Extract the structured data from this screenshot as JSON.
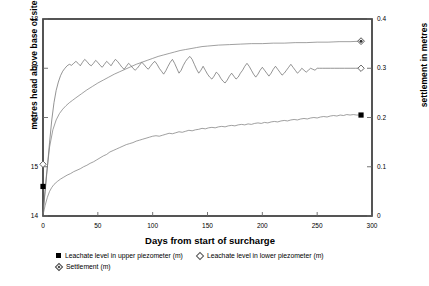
{
  "chart_data": {
    "type": "line",
    "title": "",
    "xlabel": "Days from start of surcharge",
    "ylabel": "metres head above base of site",
    "ylabel_right": "settlement in metres",
    "xlim": [
      0,
      300
    ],
    "ylim": [
      14,
      18
    ],
    "ylim_right": [
      0,
      0.4
    ],
    "grid": false,
    "legend_position": "bottom",
    "xticks": [
      "0",
      "50",
      "100",
      "150",
      "200",
      "250",
      "300"
    ],
    "xtick_values": [
      0,
      50,
      100,
      150,
      200,
      250,
      300
    ],
    "yticks_left": [
      "14",
      "15",
      "16",
      "17",
      "18"
    ],
    "ytick_values_left": [
      14,
      15,
      16,
      17,
      18
    ],
    "yticks_right": [
      "0",
      "0.1",
      "0.2",
      "0.3",
      "0.4"
    ],
    "ytick_values_right": [
      0,
      0.1,
      0.2,
      0.3,
      0.4
    ],
    "series": [
      {
        "name": "Leachate level in upper piezometer (m)",
        "axis": "left",
        "marker": "filled-square",
        "marker_color": "#000000",
        "line_color": "#777777",
        "end_point": {
          "x": 290,
          "y": 16.05
        },
        "x": [
          0,
          2,
          4,
          6,
          8,
          10,
          13,
          16,
          19,
          22,
          25,
          28,
          31,
          34,
          37,
          40,
          43,
          46,
          49,
          52,
          55,
          58,
          61,
          64,
          67,
          70,
          73,
          76,
          79,
          82,
          85,
          88,
          91,
          94,
          97,
          100,
          103,
          106,
          109,
          112,
          115,
          118,
          121,
          124,
          127,
          130,
          133,
          136,
          139,
          142,
          145,
          148,
          151,
          154,
          157,
          160,
          163,
          166,
          169,
          172,
          175,
          178,
          181,
          184,
          187,
          190,
          193,
          196,
          199,
          202,
          205,
          208,
          211,
          214,
          217,
          220,
          223,
          226,
          229,
          232,
          235,
          238,
          241,
          244,
          247,
          250,
          253,
          256,
          259,
          262,
          265,
          268,
          271,
          274,
          277,
          280,
          283,
          286,
          290
        ],
        "y": [
          14.02,
          14.22,
          14.38,
          14.5,
          14.58,
          14.64,
          14.7,
          14.75,
          14.79,
          14.83,
          14.86,
          14.9,
          14.93,
          14.96,
          15.0,
          15.03,
          15.07,
          15.1,
          15.14,
          15.18,
          15.22,
          15.25,
          15.3,
          15.33,
          15.36,
          15.39,
          15.42,
          15.45,
          15.47,
          15.49,
          15.52,
          15.54,
          15.56,
          15.58,
          15.6,
          15.62,
          15.63,
          15.62,
          15.64,
          15.66,
          15.68,
          15.67,
          15.69,
          15.71,
          15.7,
          15.72,
          15.74,
          15.73,
          15.75,
          15.76,
          15.78,
          15.77,
          15.79,
          15.8,
          15.79,
          15.81,
          15.82,
          15.81,
          15.83,
          15.84,
          15.83,
          15.85,
          15.86,
          15.85,
          15.87,
          15.86,
          15.88,
          15.89,
          15.88,
          15.9,
          15.89,
          15.91,
          15.92,
          15.91,
          15.93,
          15.94,
          15.93,
          15.95,
          15.96,
          15.95,
          15.97,
          15.98,
          15.97,
          15.99,
          16.0,
          15.99,
          16.01,
          16.02,
          16.01,
          16.03,
          16.04,
          16.03,
          16.05,
          16.04,
          16.06,
          16.05,
          16.06,
          16.05,
          16.05
        ]
      },
      {
        "name": "Leachate level in lower piezometer (m)",
        "axis": "left",
        "marker": "open-diamond",
        "marker_color": "#555555",
        "line_color": "#666666",
        "end_point": {
          "x": 290,
          "y": 17.0
        },
        "x": [
          0,
          2,
          4,
          6,
          8,
          10,
          12,
          14,
          16,
          18,
          20,
          22,
          24,
          26,
          28,
          30,
          32,
          34,
          36,
          38,
          40,
          42,
          44,
          46,
          48,
          50,
          52,
          54,
          56,
          58,
          60,
          62,
          64,
          66,
          68,
          70,
          72,
          74,
          76,
          78,
          80,
          82,
          84,
          86,
          88,
          90,
          92,
          94,
          96,
          98,
          100,
          102,
          104,
          106,
          108,
          110,
          112,
          114,
          116,
          118,
          120,
          122,
          124,
          126,
          128,
          130,
          132,
          134,
          136,
          138,
          140,
          142,
          144,
          146,
          148,
          150,
          152,
          154,
          156,
          158,
          160,
          162,
          164,
          166,
          168,
          170,
          172,
          174,
          176,
          178,
          180,
          182,
          184,
          186,
          188,
          190,
          192,
          194,
          196,
          198,
          200,
          202,
          204,
          206,
          208,
          210,
          212,
          214,
          216,
          218,
          220,
          222,
          224,
          226,
          228,
          230,
          232,
          234,
          236,
          238,
          240,
          242,
          244,
          246,
          248,
          250,
          252,
          255,
          258,
          262,
          266,
          270,
          275,
          280,
          285,
          290
        ],
        "y": [
          14.05,
          14.5,
          15.0,
          15.5,
          15.95,
          16.3,
          16.55,
          16.72,
          16.85,
          16.94,
          17.0,
          17.05,
          17.08,
          17.06,
          17.1,
          17.14,
          17.1,
          17.05,
          17.12,
          17.18,
          17.14,
          17.08,
          17.05,
          17.1,
          17.16,
          17.12,
          17.06,
          17.02,
          17.08,
          17.14,
          17.1,
          17.05,
          17.12,
          17.18,
          17.14,
          17.08,
          17.02,
          16.98,
          17.04,
          17.1,
          17.06,
          17.0,
          16.96,
          17.0,
          17.06,
          17.12,
          17.08,
          17.02,
          16.98,
          17.04,
          17.1,
          17.14,
          17.08,
          17.0,
          16.94,
          16.88,
          16.95,
          17.04,
          17.12,
          17.18,
          17.1,
          17.0,
          16.9,
          16.96,
          17.06,
          17.14,
          17.2,
          17.24,
          17.18,
          17.08,
          16.98,
          16.9,
          16.96,
          17.04,
          16.96,
          16.88,
          16.82,
          16.78,
          16.84,
          16.92,
          16.88,
          16.8,
          16.74,
          16.7,
          16.76,
          16.84,
          16.9,
          16.84,
          16.78,
          16.82,
          16.9,
          16.96,
          17.04,
          17.1,
          17.04,
          16.96,
          16.88,
          16.82,
          16.88,
          16.96,
          17.02,
          16.96,
          16.9,
          16.84,
          16.9,
          16.98,
          17.04,
          16.98,
          16.92,
          16.86,
          16.9,
          16.96,
          17.02,
          17.08,
          17.02,
          16.96,
          16.9,
          16.94,
          17.0,
          16.96,
          16.92,
          16.96,
          17.0,
          16.98,
          16.96,
          17.0,
          17.0,
          17.0,
          17.0,
          17.0,
          17.0,
          17.0,
          17.0,
          17.0,
          17.0,
          17.0
        ]
      },
      {
        "name": "Settlement (m)",
        "axis": "right",
        "marker": "dotted-diamond",
        "marker_color": "#333333",
        "line_color": "#777777",
        "end_point": {
          "x": 290,
          "y": 0.355
        },
        "x": [
          0,
          3,
          6,
          9,
          12,
          15,
          18,
          21,
          24,
          27,
          30,
          35,
          40,
          45,
          50,
          55,
          60,
          65,
          70,
          75,
          80,
          85,
          90,
          95,
          100,
          105,
          110,
          115,
          120,
          125,
          130,
          135,
          140,
          145,
          150,
          160,
          170,
          180,
          190,
          200,
          210,
          220,
          230,
          240,
          250,
          260,
          270,
          280,
          290
        ],
        "y": [
          0.005,
          0.08,
          0.14,
          0.175,
          0.195,
          0.208,
          0.217,
          0.224,
          0.23,
          0.235,
          0.24,
          0.248,
          0.256,
          0.263,
          0.27,
          0.276,
          0.282,
          0.288,
          0.293,
          0.298,
          0.303,
          0.308,
          0.312,
          0.316,
          0.32,
          0.324,
          0.327,
          0.33,
          0.333,
          0.336,
          0.338,
          0.34,
          0.342,
          0.344,
          0.345,
          0.347,
          0.348,
          0.349,
          0.35,
          0.35,
          0.351,
          0.351,
          0.352,
          0.352,
          0.353,
          0.353,
          0.354,
          0.354,
          0.355
        ]
      }
    ],
    "legend": [
      {
        "label": "Leachate level in upper piezometer (m)",
        "marker": "filled-square"
      },
      {
        "label": "Leachate level in lower piezometer (m)",
        "marker": "open-diamond"
      },
      {
        "label": "Settlement (m)",
        "marker": "dotted-diamond"
      }
    ]
  }
}
